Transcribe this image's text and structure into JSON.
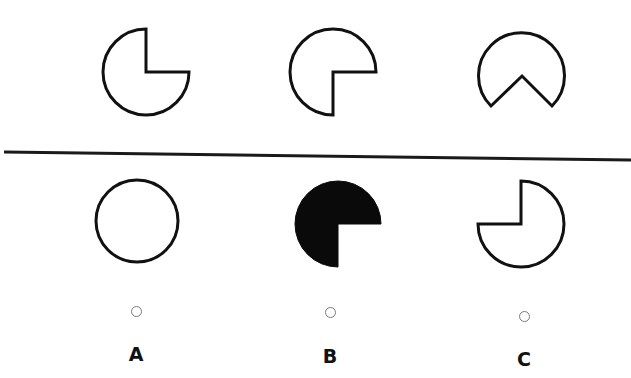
{
  "puzzle": {
    "stroke_color": "#111111",
    "fill_color": "#ffffff",
    "filled_color": "#0a0a0a",
    "background": "#ffffff",
    "divider": {
      "x1": 4,
      "y1": 152,
      "x2": 631,
      "y2": 160,
      "color": "#1a1a1a"
    },
    "sequence": [
      {
        "id": "seq-1",
        "shape": "circle-missing-top-right-quadrant",
        "filled": false
      },
      {
        "id": "seq-2",
        "shape": "circle-missing-bottom-right-quadrant",
        "filled": false
      },
      {
        "id": "seq-3",
        "shape": "circle-missing-bottom-wedge",
        "filled": false
      }
    ],
    "options": [
      {
        "label": "A",
        "shape": "full-circle",
        "filled": false
      },
      {
        "label": "B",
        "shape": "circle-missing-bottom-right-quadrant",
        "filled": true
      },
      {
        "label": "C",
        "shape": "circle-missing-top-left-quadrant",
        "filled": false
      }
    ]
  }
}
